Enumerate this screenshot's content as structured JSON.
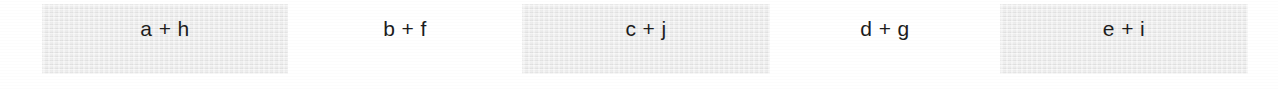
{
  "page": {
    "background_color": "#ffffff",
    "text_color": "#1c1c1c",
    "shaded_cell_color": "#e9e9e9",
    "width": 1278,
    "height": 89
  },
  "strip": {
    "cells": [
      {
        "label": "a + h",
        "shaded": true,
        "left": 42,
        "top": 4,
        "width": 246,
        "height": 70
      },
      {
        "label": "b + f",
        "shaded": false,
        "left": 288,
        "top": 4,
        "width": 234,
        "height": 70
      },
      {
        "label": "c + j",
        "shaded": true,
        "left": 522,
        "top": 4,
        "width": 248,
        "height": 70
      },
      {
        "label": "d + g",
        "shaded": false,
        "left": 770,
        "top": 4,
        "width": 230,
        "height": 70
      },
      {
        "label": "e + i",
        "shaded": true,
        "left": 1000,
        "top": 4,
        "width": 248,
        "height": 70
      }
    ]
  }
}
